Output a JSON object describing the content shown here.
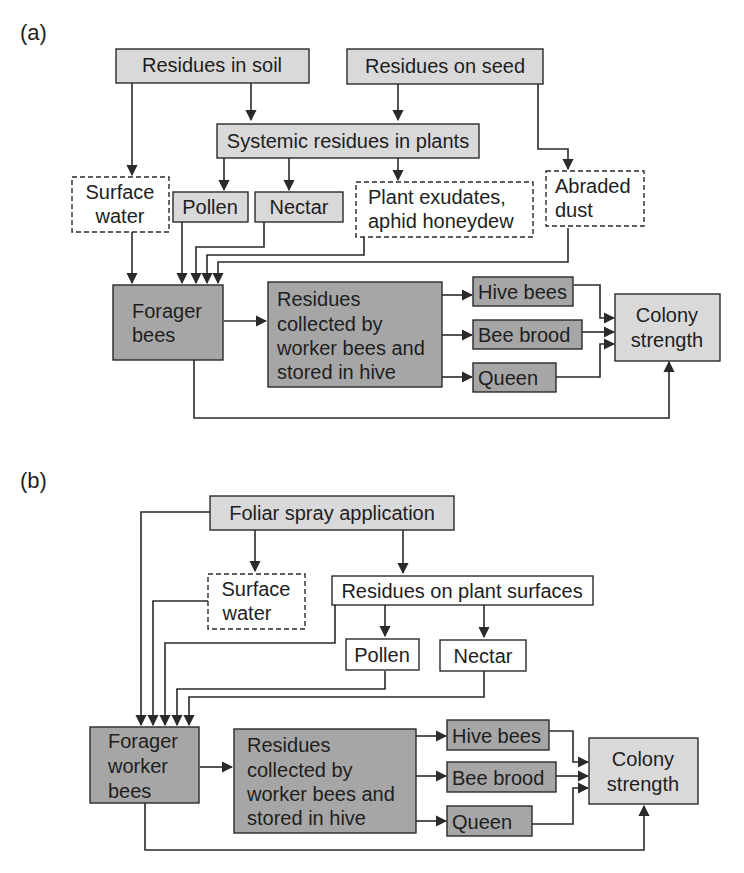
{
  "colors": {
    "light_fill": "#d9d9d9",
    "dark_fill": "#a6a6a6",
    "white_fill": "#ffffff",
    "stroke": "#2a2a2a",
    "text": "#1e1e1e"
  },
  "panel_a": {
    "label": "(a)",
    "nodes": {
      "residues_in_soil": [
        "Residues in soil"
      ],
      "residues_on_seed": [
        "Residues on seed"
      ],
      "systemic_residues": [
        "Systemic residues in plants"
      ],
      "surface_water": [
        "Surface",
        "water"
      ],
      "pollen": [
        "Pollen"
      ],
      "nectar": [
        "Nectar"
      ],
      "plant_exudates": [
        "Plant exudates,",
        "aphid honeydew"
      ],
      "abraded_dust": [
        "Abraded",
        "dust"
      ],
      "forager_bees": [
        "Forager",
        "bees"
      ],
      "residues_collected": [
        "Residues",
        "collected by",
        "worker bees and",
        "stored in hive"
      ],
      "hive_bees": [
        "Hive bees"
      ],
      "bee_brood": [
        "Bee brood"
      ],
      "queen": [
        "Queen"
      ],
      "colony_strength": [
        "Colony",
        "strength"
      ]
    }
  },
  "panel_b": {
    "label": "(b)",
    "nodes": {
      "foliar_spray": [
        "Foliar spray application"
      ],
      "surface_water": [
        "Surface",
        "water"
      ],
      "residues_plant_surfaces": [
        "Residues on plant surfaces"
      ],
      "pollen": [
        "Pollen"
      ],
      "nectar": [
        "Nectar"
      ],
      "forager_worker_bees": [
        "Forager",
        "worker",
        "bees"
      ],
      "residues_collected": [
        "Residues",
        "collected by",
        "worker bees and",
        "stored in hive"
      ],
      "hive_bees": [
        "Hive bees"
      ],
      "bee_brood": [
        "Bee brood"
      ],
      "queen": [
        "Queen"
      ],
      "colony_strength": [
        "Colony",
        "strength"
      ]
    }
  }
}
